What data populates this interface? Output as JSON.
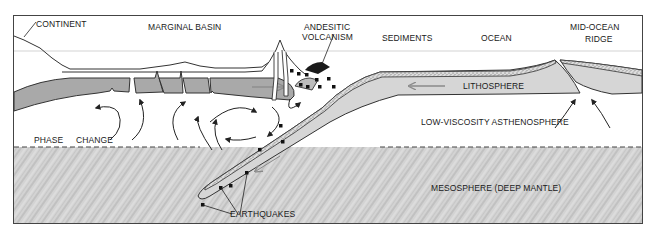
{
  "figure": {
    "header_text": "",
    "labels": {
      "continent": "CONTINENT",
      "marginal_basin": "MARGINAL BASIN",
      "andesitic_volcanism_line1": "ANDESITIC",
      "andesitic_volcanism_line2": "VOLCANISM",
      "sediments": "SEDIMENTS",
      "ocean": "OCEAN",
      "mid_ocean_ridge_line1": "MID-OCEAN",
      "mid_ocean_ridge_line2": "RIDGE",
      "lithosphere": "LITHOSPHERE",
      "phase": "PHASE",
      "change": "CHANGE",
      "asthenosphere": "LOW-VISCOSITY ASTHENOSPHERE",
      "mesosphere": "MESOSPHERE (DEEP MANTLE)",
      "earthquakes": "EARTHQUAKES"
    },
    "colors": {
      "lithosphere_gray": "#a9a9a9",
      "slab_light": "#d6d6d6",
      "mesosphere": "#cfcfcf",
      "line": "#222222",
      "arrow_gray": "#8a8a8a"
    }
  }
}
